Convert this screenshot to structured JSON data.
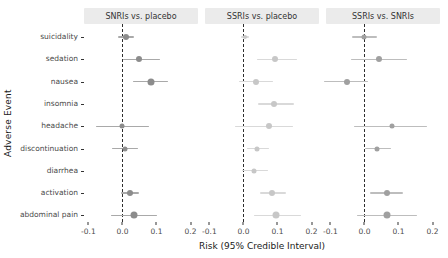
{
  "figure": {
    "y_axis_title": "Adverse Event",
    "x_axis_title": "Risk (95% Credible Interval)"
  },
  "colors": {
    "background": "#ffffff",
    "facet_strip_background": "#ebebeb",
    "reference_line": "#2e2e2e",
    "axis_text": "#4a4a4a",
    "title_text": "#1a1a1a"
  },
  "chart_data": {
    "type": "scatter",
    "subtype": "forest-plot-dot-whisker",
    "title": "",
    "xlabel": "Risk (95% Credible Interval)",
    "ylabel": "Adverse Event",
    "grid": false,
    "legend": "none",
    "reference_line_x": 0.0,
    "xlim": [
      -0.113,
      0.222
    ],
    "x_ticks": [
      {
        "value": -0.1,
        "label": "-0.1"
      },
      {
        "value": 0.0,
        "label": "0.0"
      },
      {
        "value": 0.1,
        "label": "0.1"
      },
      {
        "value": 0.2,
        "label": "0.2"
      }
    ],
    "categories": [
      "suicidality",
      "sedation",
      "nausea",
      "insomnia",
      "headache",
      "discontinuation",
      "diarrhea",
      "activation",
      "abdominal pain"
    ],
    "series": [
      {
        "name": "SNRIs vs. placebo",
        "point_color": "#8c8c8c",
        "line_color": "#a9a9a9",
        "estimates": [
          {
            "est": 0.01,
            "lo": -0.012,
            "hi": 0.035,
            "size": 6
          },
          {
            "est": 0.05,
            "lo": 0.002,
            "hi": 0.11,
            "size": 6
          },
          {
            "est": 0.085,
            "lo": 0.032,
            "hi": 0.135,
            "size": 7
          },
          null,
          {
            "est": 0.0,
            "lo": -0.078,
            "hi": 0.078,
            "size": 5
          },
          {
            "est": 0.008,
            "lo": -0.03,
            "hi": 0.045,
            "size": 5
          },
          null,
          {
            "est": 0.022,
            "lo": -0.005,
            "hi": 0.05,
            "size": 6
          },
          {
            "est": 0.035,
            "lo": -0.035,
            "hi": 0.102,
            "size": 7
          }
        ]
      },
      {
        "name": "SSRIs vs. placebo",
        "point_color": "#c7c7c7",
        "line_color": "#d9d9d9",
        "estimates": [
          {
            "est": 0.004,
            "lo": -0.006,
            "hi": 0.016,
            "size": 4
          },
          {
            "est": 0.094,
            "lo": 0.04,
            "hi": 0.156,
            "size": 6
          },
          {
            "est": 0.036,
            "lo": -0.014,
            "hi": 0.086,
            "size": 6
          },
          {
            "est": 0.09,
            "lo": 0.042,
            "hi": 0.148,
            "size": 6
          },
          {
            "est": 0.076,
            "lo": -0.024,
            "hi": 0.146,
            "size": 6
          },
          {
            "est": 0.04,
            "lo": 0.01,
            "hi": 0.076,
            "size": 5
          },
          {
            "est": 0.032,
            "lo": -0.004,
            "hi": 0.072,
            "size": 5
          },
          {
            "est": 0.084,
            "lo": 0.05,
            "hi": 0.124,
            "size": 6
          },
          {
            "est": 0.096,
            "lo": 0.032,
            "hi": 0.17,
            "size": 7
          }
        ]
      },
      {
        "name": "SSRIs vs. SNRIs",
        "point_color": "#a0a0a0",
        "line_color": "#bdbdbd",
        "estimates": [
          {
            "est": 0.0,
            "lo": -0.038,
            "hi": 0.038,
            "size": 5
          },
          {
            "est": 0.044,
            "lo": -0.04,
            "hi": 0.126,
            "size": 6
          },
          {
            "est": -0.05,
            "lo": -0.12,
            "hi": 0.01,
            "size": 6
          },
          null,
          {
            "est": 0.08,
            "lo": -0.03,
            "hi": 0.185,
            "size": 5
          },
          {
            "est": 0.038,
            "lo": 0.002,
            "hi": 0.078,
            "size": 5
          },
          null,
          {
            "est": 0.066,
            "lo": 0.016,
            "hi": 0.114,
            "size": 6
          },
          {
            "est": 0.066,
            "lo": -0.021,
            "hi": 0.154,
            "size": 7
          }
        ]
      }
    ]
  }
}
